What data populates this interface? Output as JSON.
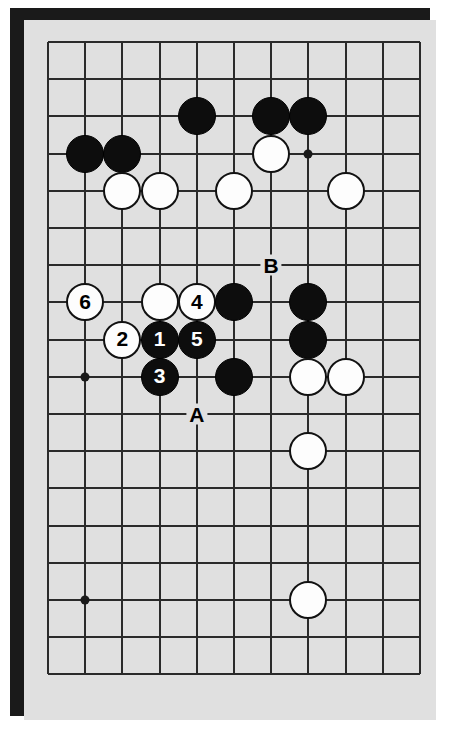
{
  "diagram": {
    "kind": "go-board-diagram",
    "board_background_color": "#e0e0e0",
    "frame_color": "#1a1a1a",
    "line_color": "#2a2a2a",
    "black_stone_color": "#0d0d0d",
    "white_stone_color": "#fdfdfd",
    "grid": {
      "columns": 11,
      "rows": 18,
      "x_start": 24,
      "y_start": 22,
      "spacing": 37.2
    },
    "star_points": [
      {
        "col": 1,
        "row": 9
      },
      {
        "col": 7,
        "row": 3
      },
      {
        "col": 1,
        "row": 15
      }
    ],
    "stones": [
      {
        "col": 1,
        "row": 3,
        "color": "black",
        "label": ""
      },
      {
        "col": 2,
        "row": 3,
        "color": "black",
        "label": ""
      },
      {
        "col": 4,
        "row": 2,
        "color": "black",
        "label": ""
      },
      {
        "col": 6,
        "row": 2,
        "color": "black",
        "label": ""
      },
      {
        "col": 7,
        "row": 2,
        "color": "black",
        "label": ""
      },
      {
        "col": 6,
        "row": 3,
        "color": "white",
        "label": ""
      },
      {
        "col": 2,
        "row": 4,
        "color": "white",
        "label": ""
      },
      {
        "col": 3,
        "row": 4,
        "color": "white",
        "label": ""
      },
      {
        "col": 5,
        "row": 4,
        "color": "white",
        "label": ""
      },
      {
        "col": 8,
        "row": 4,
        "color": "white",
        "label": ""
      },
      {
        "col": 1,
        "row": 7,
        "color": "white",
        "label": "6"
      },
      {
        "col": 3,
        "row": 7,
        "color": "white",
        "label": ""
      },
      {
        "col": 4,
        "row": 7,
        "color": "white",
        "label": "4"
      },
      {
        "col": 5,
        "row": 7,
        "color": "black",
        "label": ""
      },
      {
        "col": 7,
        "row": 7,
        "color": "black",
        "label": ""
      },
      {
        "col": 2,
        "row": 8,
        "color": "white",
        "label": "2"
      },
      {
        "col": 3,
        "row": 8,
        "color": "black",
        "label": "1"
      },
      {
        "col": 4,
        "row": 8,
        "color": "black",
        "label": "5"
      },
      {
        "col": 7,
        "row": 8,
        "color": "black",
        "label": ""
      },
      {
        "col": 3,
        "row": 9,
        "color": "black",
        "label": "3"
      },
      {
        "col": 5,
        "row": 9,
        "color": "black",
        "label": ""
      },
      {
        "col": 7,
        "row": 9,
        "color": "white",
        "label": ""
      },
      {
        "col": 8,
        "row": 9,
        "color": "white",
        "label": ""
      },
      {
        "col": 7,
        "row": 11,
        "color": "white",
        "label": ""
      },
      {
        "col": 7,
        "row": 15,
        "color": "white",
        "label": ""
      }
    ],
    "point_labels": [
      {
        "text": "B",
        "col": 6,
        "row": 6
      },
      {
        "text": "A",
        "col": 4,
        "row": 10
      }
    ]
  }
}
